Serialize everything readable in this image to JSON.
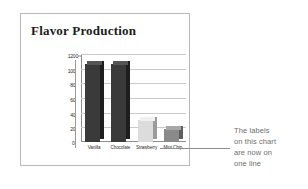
{
  "document": {
    "chart_title": "Flavor Production"
  },
  "annotation": {
    "lines": [
      "The labels",
      "on this chart",
      "are now on",
      "one line"
    ],
    "text": "The labels on this chart are now on one line",
    "color": "#6e6e6e"
  },
  "axis": {
    "y_ticks": [
      "1200",
      "1000",
      "800",
      "600",
      "400",
      "200",
      "0"
    ],
    "zero_label": "0"
  },
  "colors": {
    "frame_border": "#b9b9b9",
    "gridline": "#c9c9c9",
    "axis": "#8d8d8d",
    "bar_dark_face": "#3a3a3a",
    "bar_dark_side": "#1e1e1e",
    "bar_dark_top": "#555555",
    "bar_light_face": "#dcdcdc",
    "bar_light_side": "#9b9b9b",
    "bar_light_top": "#f0f0f0",
    "bar_mid_face": "#8a8a8a",
    "bar_mid_side": "#5e5e5e",
    "bar_mid_top": "#a8a8a8",
    "title_color": "#1c1c1c"
  },
  "chart_data": {
    "type": "bar",
    "title": "Flavor Production",
    "xlabel": "",
    "ylabel": "",
    "categories": [
      "Vanilla",
      "Chocolate",
      "Strawberry",
      "Mint Chip"
    ],
    "values": [
      1060,
      1070,
      300,
      180
    ],
    "ylim": [
      0,
      1200
    ],
    "ytick_values": [
      0,
      200,
      400,
      600,
      800,
      1000,
      1200
    ],
    "grid": true,
    "legend": false,
    "style": "3d-column",
    "bar_colors": [
      "#3a3a3a",
      "#3a3a3a",
      "#dcdcdc",
      "#8a8a8a"
    ]
  }
}
